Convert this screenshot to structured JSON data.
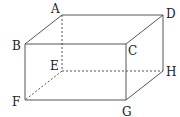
{
  "diagram": {
    "type": "rectangular-prism",
    "stroke_color": "#555555",
    "vertices": {
      "A": {
        "x": 62,
        "y": 15,
        "label": "A",
        "lx": 51,
        "ly": 13
      },
      "B": {
        "x": 25,
        "y": 44,
        "label": "B",
        "lx": 12,
        "ly": 50
      },
      "C": {
        "x": 126,
        "y": 44,
        "label": "C",
        "lx": 128,
        "ly": 55
      },
      "D": {
        "x": 163,
        "y": 15,
        "label": "D",
        "lx": 166,
        "ly": 18
      },
      "E": {
        "x": 62,
        "y": 71,
        "label": "E",
        "lx": 50,
        "ly": 70
      },
      "F": {
        "x": 25,
        "y": 100,
        "label": "F",
        "lx": 12,
        "ly": 106
      },
      "G": {
        "x": 126,
        "y": 100,
        "label": "G",
        "lx": 122,
        "ly": 116
      },
      "H": {
        "x": 163,
        "y": 71,
        "label": "H",
        "lx": 166,
        "ly": 76
      }
    },
    "solid_edges": [
      [
        "A",
        "D"
      ],
      [
        "B",
        "C"
      ],
      [
        "A",
        "B"
      ],
      [
        "D",
        "C"
      ],
      [
        "B",
        "F"
      ],
      [
        "C",
        "G"
      ],
      [
        "D",
        "H"
      ],
      [
        "F",
        "G"
      ],
      [
        "G",
        "H"
      ]
    ],
    "dashed_edges": [
      [
        "A",
        "E"
      ],
      [
        "E",
        "F"
      ],
      [
        "E",
        "H"
      ]
    ]
  }
}
